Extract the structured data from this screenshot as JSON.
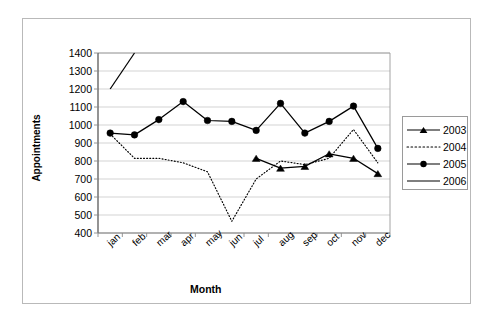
{
  "chart_data": {
    "type": "line",
    "title": "",
    "xlabel": "Month",
    "ylabel": "Appointments",
    "categories": [
      "jan",
      "feb",
      "mar",
      "apr",
      "may",
      "jun",
      "jul",
      "aug",
      "sep",
      "oct",
      "nov",
      "dec"
    ],
    "ylim": [
      400,
      1400
    ],
    "ytick_labels": [
      "1400",
      "1300",
      "1200",
      "1100",
      "1000",
      "900",
      "800",
      "700",
      "600",
      "500",
      "400"
    ],
    "ytick_values": [
      1400,
      1300,
      1200,
      1100,
      1000,
      900,
      800,
      700,
      600,
      500,
      400
    ],
    "grid": true,
    "grid_axis": "y",
    "legend_position": "right",
    "series": [
      {
        "name": "2003",
        "marker": "triangle",
        "line_style": "solid",
        "color": "#000000",
        "values": [
          null,
          null,
          null,
          null,
          null,
          null,
          815,
          760,
          770,
          840,
          815,
          730
        ]
      },
      {
        "name": "2004",
        "marker": "none",
        "line_style": "dotted",
        "color": "#000000",
        "values": [
          950,
          815,
          815,
          790,
          740,
          465,
          700,
          800,
          780,
          815,
          975,
          790
        ]
      },
      {
        "name": "2005",
        "marker": "circle",
        "line_style": "solid",
        "color": "#000000",
        "values": [
          955,
          945,
          1030,
          1130,
          1025,
          1020,
          970,
          1120,
          955,
          1020,
          1105,
          870
        ]
      },
      {
        "name": "2006",
        "marker": "none",
        "line_style": "solid",
        "color": "#000000",
        "values": [
          1200,
          1400,
          null,
          null,
          null,
          null,
          null,
          null,
          null,
          null,
          null,
          null
        ]
      }
    ]
  },
  "legend": {
    "entries": [
      {
        "label": "2003"
      },
      {
        "label": "2004"
      },
      {
        "label": "2005"
      },
      {
        "label": "2006"
      }
    ]
  }
}
